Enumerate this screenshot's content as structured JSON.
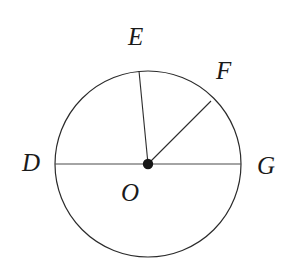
{
  "figure": {
    "kind": "geometry-diagram",
    "background_color": "#ffffff",
    "stroke_color": "#2b2b2b",
    "label_color": "#1a1a1a",
    "canvas": {
      "width": 297,
      "height": 278
    }
  },
  "circle": {
    "center_x": 148,
    "center_y": 164,
    "radius": 93,
    "stroke_width": 1.2
  },
  "center_point": {
    "label": "O",
    "x": 148,
    "y": 164,
    "dot_radius": 5.2
  },
  "segments": [
    {
      "name": "diameter-DG",
      "from": "D",
      "to": "G",
      "x1": 55,
      "y1": 164,
      "x2": 241,
      "y2": 164
    },
    {
      "name": "radius-OE",
      "from": "O",
      "to": "E",
      "x1": 148,
      "y1": 164,
      "x2": 139,
      "y2": 71
    },
    {
      "name": "radius-OF",
      "from": "O",
      "to": "F",
      "x1": 148,
      "y1": 164,
      "x2": 211,
      "y2": 101
    }
  ],
  "labels": [
    {
      "text": "D",
      "name": "point-label-d",
      "left": 22,
      "top": 150
    },
    {
      "text": "E",
      "name": "point-label-e",
      "left": 128,
      "top": 24
    },
    {
      "text": "F",
      "name": "point-label-f",
      "left": 216,
      "top": 58
    },
    {
      "text": "G",
      "name": "point-label-g",
      "left": 257,
      "top": 153
    },
    {
      "text": "O",
      "name": "point-label-o",
      "left": 121,
      "top": 180
    }
  ]
}
